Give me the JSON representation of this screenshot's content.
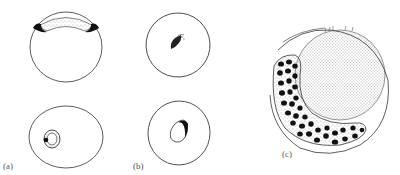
{
  "figure": {
    "panels": [
      {
        "id": "a",
        "label": "(a)",
        "subfigures": [
          "top-view-egg-with-cap",
          "bottom-view-egg-with-ring"
        ]
      },
      {
        "id": "b",
        "label": "(b)",
        "subfigures": [
          "egg-with-comet-mark",
          "egg-with-inner-oval"
        ]
      },
      {
        "id": "c",
        "label": "(c)",
        "subfigures": [
          "egg-with-stippled-sphere-and-spotted-crescent"
        ]
      }
    ],
    "colors": {
      "line": "#333333",
      "fill_dark": "#111111",
      "stipple": "#444444",
      "background": "#ffffff"
    }
  }
}
